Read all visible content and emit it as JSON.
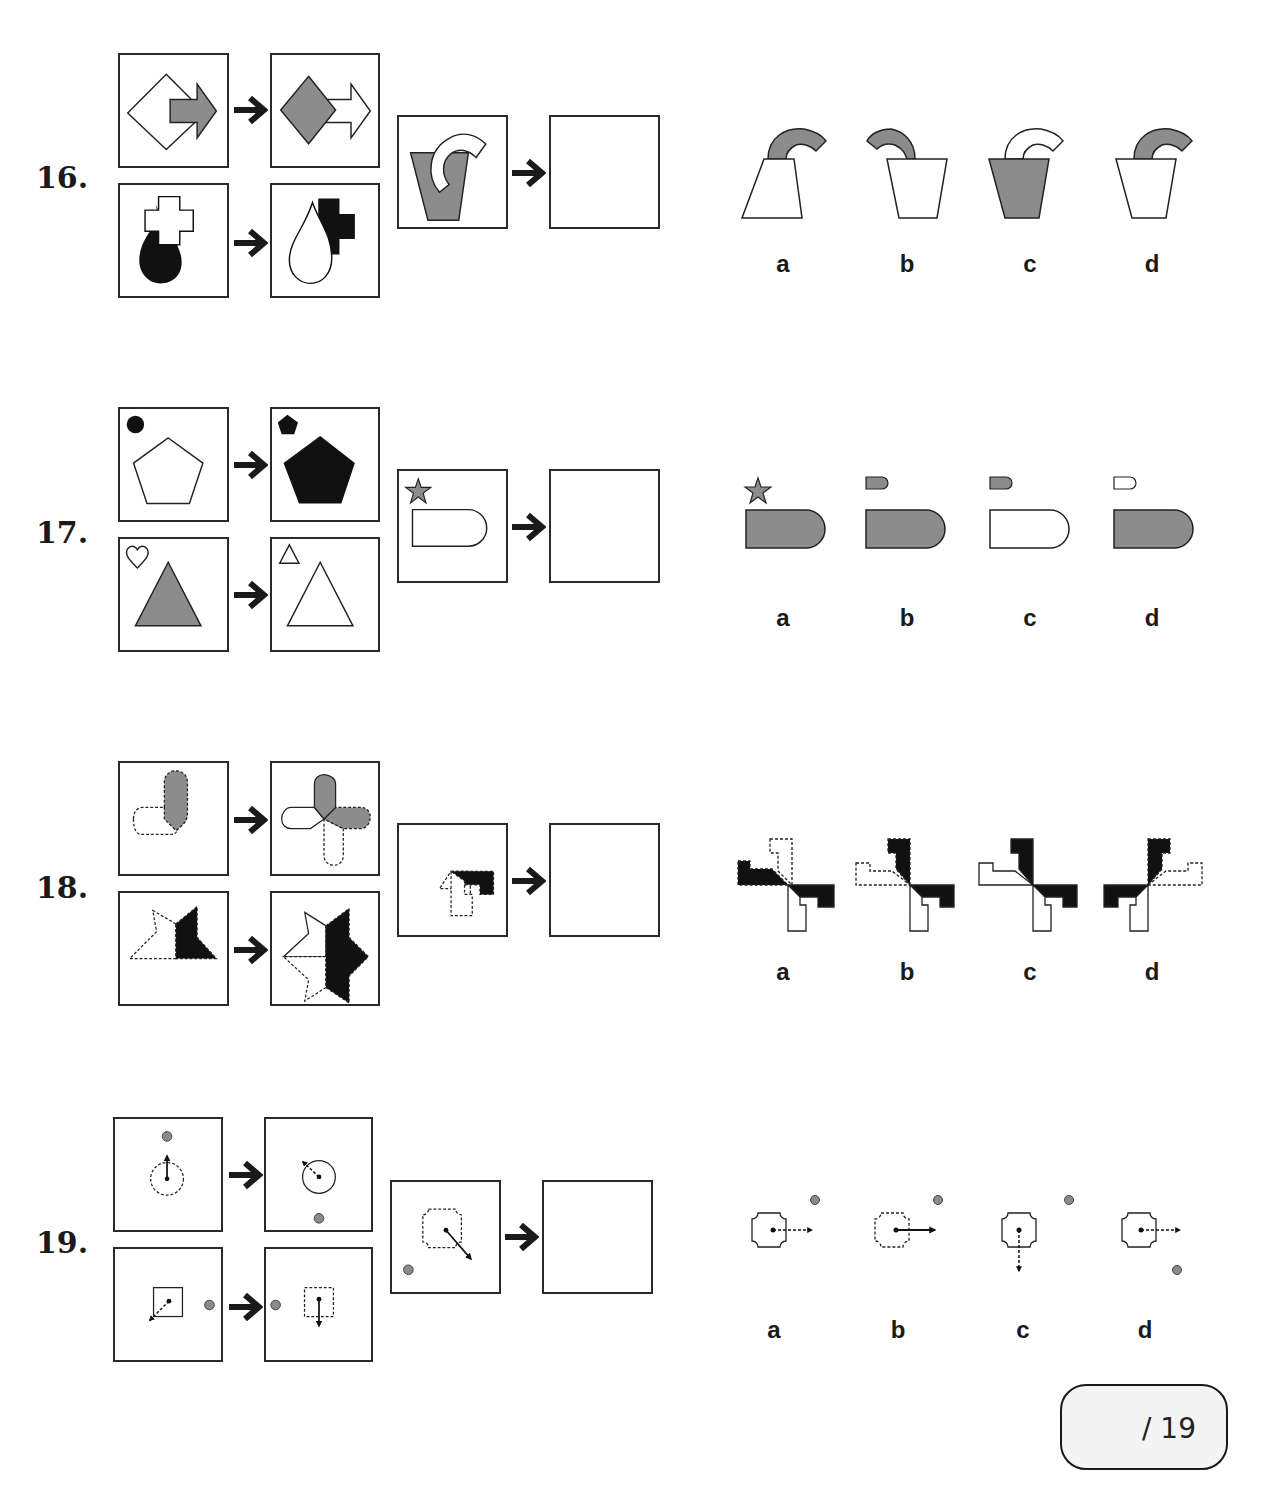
{
  "questions": [
    {
      "number": "16.",
      "examples": [
        {
          "before": "white diamond behind grey arrow pointing right",
          "after": "grey diamond in front of white arrow pointing right"
        },
        {
          "before": "black teardrop behind white cross",
          "after": "white teardrop in front of black cross"
        }
      ],
      "query": "grey trapezoid pot in front of white curved hook",
      "options": [
        {
          "label": "a",
          "desc": "white inverted-trapezoid, grey hook behind"
        },
        {
          "label": "b",
          "desc": "white pot, grey hook curving left, behind"
        },
        {
          "label": "c",
          "desc": "grey pot in front, white hook behind"
        },
        {
          "label": "d",
          "desc": "white pot in front, grey hook behind"
        }
      ]
    },
    {
      "number": "17.",
      "examples": [
        {
          "before": "black circle small, white pentagon",
          "after": "black small pentagon, black pentagon"
        },
        {
          "before": "white small heart, grey triangle",
          "after": "white small triangle, white triangle"
        }
      ],
      "query": "grey small star, white D-shape",
      "options": [
        {
          "label": "a",
          "desc": "grey star, grey D-shape"
        },
        {
          "label": "b",
          "desc": "grey small D, grey D-shape"
        },
        {
          "label": "c",
          "desc": "grey small D, white D-shape"
        },
        {
          "label": "d",
          "desc": "white small D, grey D-shape"
        }
      ]
    },
    {
      "number": "18.",
      "examples": [
        {
          "before": "grey pill with dashed pill",
          "after": "four-way pill cross"
        },
        {
          "before": "dashed half-star with black half",
          "after": "mirrored star"
        }
      ],
      "query": "black L-shape with dashed L-shape",
      "options": [
        {
          "label": "a"
        },
        {
          "label": "b"
        },
        {
          "label": "c"
        },
        {
          "label": "d"
        }
      ]
    },
    {
      "number": "19.",
      "examples": [
        {
          "before": "dashed circle with solid arrow up, grey dot above",
          "after": "solid circle with dashed arrow up-left, grey dot below"
        },
        {
          "before": "solid square with dashed arrow down-left, grey dot right",
          "after": "dashed square with solid arrow down, grey dot left"
        }
      ],
      "query": "dashed octagon with solid arrow down-right, grey dot lower-left",
      "options": [
        {
          "label": "a"
        },
        {
          "label": "b"
        },
        {
          "label": "c"
        },
        {
          "label": "d"
        }
      ]
    }
  ],
  "score": {
    "text": "/ 19"
  },
  "colors": {
    "grey": "#8c8c8c",
    "black": "#111111",
    "line": "#2a2a2a",
    "dot": "#8a8a8a"
  }
}
